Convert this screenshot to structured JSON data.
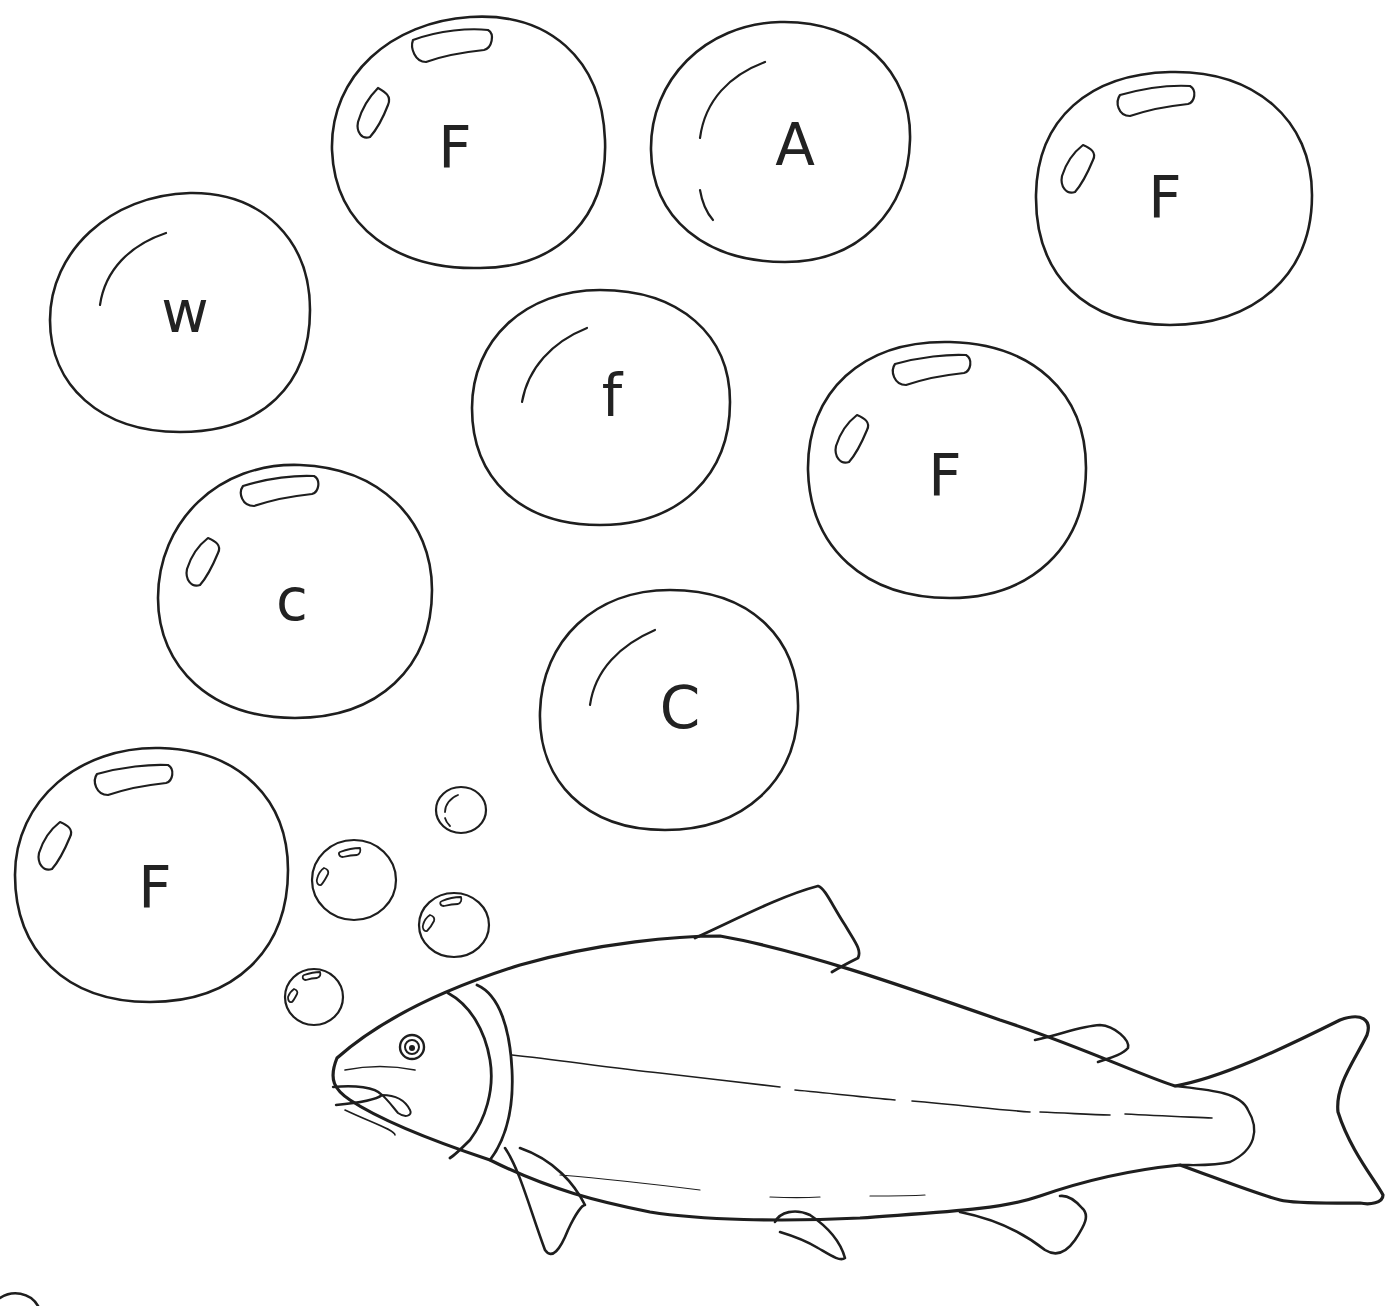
{
  "worksheet": {
    "description": "Coloring worksheet: find the letter F in the bubbles",
    "stroke_color": "#1e1e1e",
    "letter_color": "#222222",
    "background": "#ffffff"
  },
  "bubbles": [
    {
      "letter": "F",
      "x": 470,
      "y": 148,
      "style": "shine"
    },
    {
      "letter": "A",
      "x": 795,
      "y": 145,
      "style": "arc"
    },
    {
      "letter": "F",
      "x": 1165,
      "y": 198,
      "style": "shine"
    },
    {
      "letter": "w",
      "x": 185,
      "y": 318,
      "style": "arc"
    },
    {
      "letter": "f",
      "x": 612,
      "y": 400,
      "style": "arc"
    },
    {
      "letter": "F",
      "x": 945,
      "y": 478,
      "style": "shine"
    },
    {
      "letter": "c",
      "x": 292,
      "y": 605,
      "style": "shine"
    },
    {
      "letter": "C",
      "x": 680,
      "y": 710,
      "style": "arc"
    },
    {
      "letter": "F",
      "x": 155,
      "y": 888,
      "style": "shine"
    }
  ],
  "fish": {
    "label": "salmon"
  }
}
